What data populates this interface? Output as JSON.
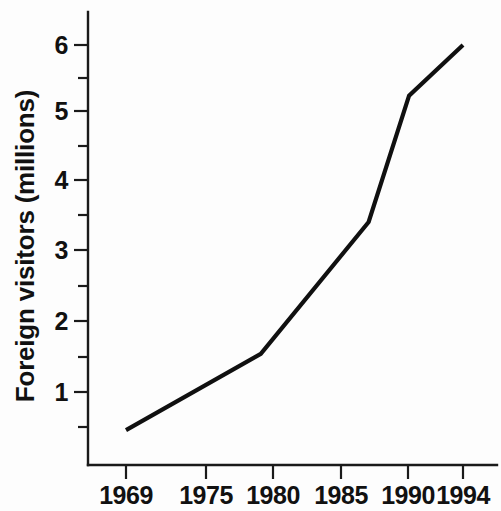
{
  "chart_data": {
    "type": "line",
    "title": "",
    "subtitle": "",
    "xlabel": "",
    "ylabel": "Foreign visitors (millions)",
    "x": [
      1969,
      1979,
      1987,
      1990,
      1994
    ],
    "values": [
      0.45,
      1.55,
      3.45,
      5.27,
      6.0
    ],
    "series": [
      {
        "name": "Foreign visitors",
        "x": [
          1969,
          1979,
          1987,
          1990,
          1994
        ],
        "values": [
          0.45,
          1.55,
          3.45,
          5.27,
          6.0
        ],
        "color": "#101010"
      }
    ],
    "xlim": [
      1966.5,
      1995.5
    ],
    "ylim": [
      0.0,
      6.45
    ],
    "xtick_values": [
      1969,
      1975,
      1980,
      1985,
      1990,
      1994
    ],
    "xtick_labels": [
      "1969",
      "1975",
      "1980",
      "1985",
      "1990",
      "1994"
    ],
    "ytick_values": [
      1,
      2,
      3,
      4,
      5,
      6
    ],
    "ytick_labels": [
      "1",
      "2",
      "3",
      "4",
      "5",
      "6"
    ],
    "yminor_tick_values": [
      0.5,
      1.5,
      2.5,
      3.5,
      4.5,
      5.5,
      6.5
    ],
    "grid": false,
    "legend": false,
    "legend_position": "none",
    "annotations": []
  },
  "axes": {
    "y_tick_labels": [
      {
        "text": "6",
        "value": 6
      },
      {
        "text": "5",
        "value": 5
      },
      {
        "text": "4",
        "value": 4
      },
      {
        "text": "3",
        "value": 3
      },
      {
        "text": "2",
        "value": 2
      },
      {
        "text": "1",
        "value": 1
      }
    ],
    "x_tick_labels": [
      {
        "text": "1969",
        "value": 1969
      },
      {
        "text": "1975",
        "value": 1975
      },
      {
        "text": "1980",
        "value": 1980
      },
      {
        "text": "1985",
        "value": 1985
      },
      {
        "text": "1990",
        "value": 1990
      },
      {
        "text": "1994",
        "value": 1994
      }
    ],
    "y_axis_label": "Foreign visitors (millions)",
    "x_axis_label": ""
  },
  "style": {
    "background": "#fdfdfd",
    "axis_color": "#1a1a1a",
    "line_color": "#101010",
    "text_color": "#111111"
  }
}
